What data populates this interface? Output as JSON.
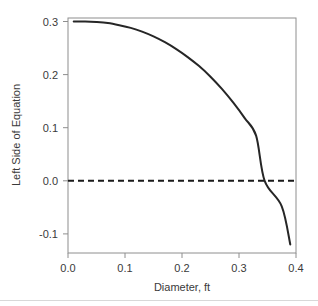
{
  "chart_data": {
    "type": "line",
    "title": "",
    "xlabel": "Diameter, ft",
    "ylabel": "Left Side of Equation",
    "xlim": [
      0.0,
      0.4
    ],
    "ylim": [
      -0.13,
      0.31
    ],
    "xticks": [
      "0.0",
      "0.1",
      "0.2",
      "0.3",
      "0.4"
    ],
    "xtick_values": [
      0.0,
      0.1,
      0.2,
      0.3,
      0.4
    ],
    "yticks": [
      "0.3",
      "0.2",
      "0.1",
      "0.0",
      "-0.1"
    ],
    "ytick_values": [
      0.3,
      0.2,
      0.1,
      0.0,
      -0.1
    ],
    "grid": false,
    "legend": "none",
    "series": [
      {
        "name": "Left Side of Equation",
        "style": "solid",
        "color": "#262626",
        "x": [
          0.01,
          0.03,
          0.05,
          0.07,
          0.09,
          0.11,
          0.13,
          0.15,
          0.17,
          0.19,
          0.21,
          0.23,
          0.25,
          0.27,
          0.29,
          0.31,
          0.33,
          0.345,
          0.36,
          0.375,
          0.39
        ],
        "y": [
          0.3,
          0.3,
          0.299,
          0.297,
          0.293,
          0.288,
          0.281,
          0.272,
          0.261,
          0.248,
          0.233,
          0.216,
          0.196,
          0.173,
          0.147,
          0.118,
          0.085,
          0.0,
          0.022,
          -0.048,
          -0.12
        ]
      }
    ],
    "annotations": [
      {
        "name": "zero-reference-line",
        "type": "hline",
        "value": 0.0,
        "style": "dashed",
        "color": "#1a1a1a"
      }
    ],
    "zero_crossing_x": 0.345
  },
  "figure": {
    "background_color": "#ffffff",
    "frame_color": "#8e8e8e",
    "text_color": "#3a3a3a",
    "footer_rule_color": "#d8d8d8"
  }
}
